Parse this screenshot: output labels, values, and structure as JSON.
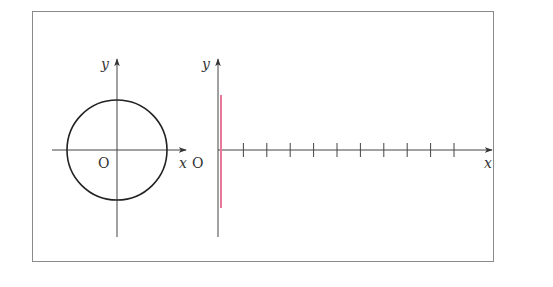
{
  "figure": {
    "frame": {
      "x1": 32,
      "y1": 11,
      "x2": 493,
      "y2": 261,
      "color": "#8a8a8a"
    },
    "left_plot": {
      "origin_label": "O",
      "x_label": "x",
      "y_label": "y",
      "circle": {
        "cx": 117,
        "cy": 150,
        "r": 50,
        "color": "#222222"
      },
      "x_axis": {
        "from": 52,
        "to": 186,
        "y": 150
      },
      "y_axis": {
        "x": 117,
        "from": 237,
        "to": 59
      }
    },
    "right_plot": {
      "origin_label": "O",
      "x_label": "x",
      "y_label": "y",
      "x_axis": {
        "from": 218,
        "to": 492,
        "y": 150
      },
      "y_axis": {
        "x": 218,
        "from": 237,
        "to": 59
      },
      "tick_count": 10,
      "tick_spacing": 23.4,
      "highlight_segment": {
        "x": 221,
        "y1": 95,
        "y2": 208,
        "color": "#e8789a"
      }
    },
    "axis_color": "#444444"
  }
}
